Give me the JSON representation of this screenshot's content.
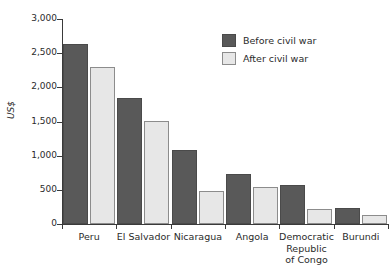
{
  "chart_data": {
    "type": "bar",
    "title": "",
    "subtitle": "",
    "xlabel": "",
    "ylabel": "US$",
    "ylim": [
      0,
      3000
    ],
    "grid": false,
    "legend_position": "top-right",
    "categories": [
      "Peru",
      "El Salvador",
      "Nicaragua",
      "Angola",
      "Democratic\nRepublic\nof Congo",
      "Burundi"
    ],
    "y_ticks": [
      0,
      500,
      1000,
      1500,
      2000,
      2500,
      3000
    ],
    "y_tick_labels": [
      "0",
      "500",
      "1,000",
      "1,500",
      "2,000",
      "2,500",
      "3,000"
    ],
    "series": [
      {
        "name": "Before civil war",
        "color": "#595959",
        "values": [
          2630,
          1850,
          1090,
          730,
          575,
          235
        ]
      },
      {
        "name": "After civil war",
        "color": "#e7e7e7",
        "values": [
          2300,
          1510,
          490,
          545,
          225,
          125
        ]
      }
    ]
  },
  "axis": {
    "y_title": "US$"
  },
  "category_labels": [
    {
      "lines": [
        "Peru"
      ]
    },
    {
      "lines": [
        "El Salvador"
      ]
    },
    {
      "lines": [
        "Nicaragua"
      ]
    },
    {
      "lines": [
        "Angola"
      ]
    },
    {
      "lines": [
        "Democratic",
        "Republic",
        "of Congo"
      ]
    },
    {
      "lines": [
        "Burundi"
      ]
    }
  ],
  "legend": {
    "items": [
      {
        "label": "Before civil war",
        "key": "before"
      },
      {
        "label": "After civil war",
        "key": "after"
      }
    ]
  }
}
